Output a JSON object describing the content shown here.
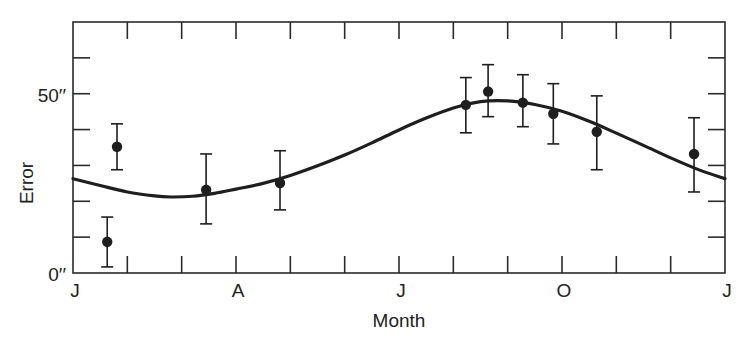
{
  "chart_data": {
    "type": "scatter",
    "title": "",
    "xlabel": "Month",
    "ylabel": "Error",
    "x_tick_labels": [
      {
        "label": "J",
        "month": 0
      },
      {
        "label": "A",
        "month": 3
      },
      {
        "label": "J",
        "month": 6
      },
      {
        "label": "O",
        "month": 9
      },
      {
        "label": "J",
        "month": 12
      }
    ],
    "y_tick_labels": [
      {
        "label": "0′′",
        "value": 0
      },
      {
        "label": "50′′",
        "value": 50
      }
    ],
    "xlim": [
      0,
      12
    ],
    "ylim": [
      0,
      70
    ],
    "minor_ticks": {
      "x_every_months": 1,
      "y_every_arcsec": 10
    },
    "grid": false,
    "legend": null,
    "series": [
      {
        "name": "Observed error",
        "kind": "points_with_error_bars",
        "points": [
          {
            "month": 0.63,
            "value": 8.7,
            "err_low": 1.7,
            "err_high": 15.6
          },
          {
            "month": 0.81,
            "value": 35.2,
            "err_low": 28.8,
            "err_high": 41.6
          },
          {
            "month": 2.45,
            "value": 23.2,
            "err_low": 13.7,
            "err_high": 33.2
          },
          {
            "month": 3.81,
            "value": 25.1,
            "err_low": 17.6,
            "err_high": 34.1
          },
          {
            "month": 7.23,
            "value": 46.9,
            "err_low": 39.1,
            "err_high": 54.5
          },
          {
            "month": 7.64,
            "value": 50.6,
            "err_low": 43.6,
            "err_high": 58.1
          },
          {
            "month": 8.28,
            "value": 47.5,
            "err_low": 40.8,
            "err_high": 55.3
          },
          {
            "month": 8.84,
            "value": 44.4,
            "err_low": 36.0,
            "err_high": 52.8
          },
          {
            "month": 9.64,
            "value": 39.4,
            "err_low": 28.8,
            "err_high": 49.4
          },
          {
            "month": 11.43,
            "value": 33.2,
            "err_low": 22.6,
            "err_high": 43.3
          }
        ]
      },
      {
        "name": "Fitted curve",
        "kind": "line",
        "points": [
          {
            "month": 0.0,
            "value": 26.3
          },
          {
            "month": 0.5,
            "value": 24.4
          },
          {
            "month": 1.0,
            "value": 22.6
          },
          {
            "month": 1.5,
            "value": 21.5
          },
          {
            "month": 1.8,
            "value": 21.2
          },
          {
            "month": 2.2,
            "value": 21.4
          },
          {
            "month": 2.6,
            "value": 22.2
          },
          {
            "month": 3.0,
            "value": 23.4
          },
          {
            "month": 3.5,
            "value": 25.0
          },
          {
            "month": 4.0,
            "value": 27.2
          },
          {
            "month": 4.5,
            "value": 29.9
          },
          {
            "month": 5.0,
            "value": 32.9
          },
          {
            "month": 5.5,
            "value": 36.3
          },
          {
            "month": 6.0,
            "value": 39.9
          },
          {
            "month": 6.5,
            "value": 43.2
          },
          {
            "month": 7.0,
            "value": 46.0
          },
          {
            "month": 7.5,
            "value": 47.8
          },
          {
            "month": 8.0,
            "value": 48.0
          },
          {
            "month": 8.5,
            "value": 47.0
          },
          {
            "month": 9.0,
            "value": 45.1
          },
          {
            "month": 9.5,
            "value": 42.3
          },
          {
            "month": 10.0,
            "value": 39.0
          },
          {
            "month": 10.5,
            "value": 35.6
          },
          {
            "month": 11.0,
            "value": 32.1
          },
          {
            "month": 11.5,
            "value": 28.9
          },
          {
            "month": 12.0,
            "value": 26.3
          }
        ]
      }
    ],
    "layout": {
      "plot_left": 73,
      "plot_right": 725,
      "plot_top": 22,
      "plot_bottom": 273,
      "line_color": "#1e1e1e",
      "axis_color": "#2a2a2a"
    }
  }
}
